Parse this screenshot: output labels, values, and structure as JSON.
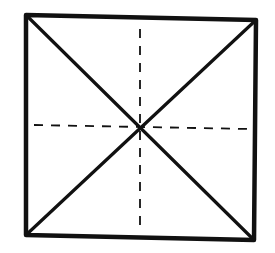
{
  "diagram": {
    "background": "#ffffff",
    "stroke_color": "#111111",
    "square": {
      "corners": {
        "top_left": [
          26,
          15
        ],
        "top_right": [
          256,
          20
        ],
        "bottom_right": [
          254,
          240
        ],
        "bottom_left": [
          26,
          235
        ]
      },
      "stroke_width": 4.5
    },
    "diagonals": [
      {
        "name": "diagonal-tl-br",
        "from": [
          26,
          15
        ],
        "to": [
          254,
          240
        ],
        "style": "solid",
        "stroke_width": 3.2
      },
      {
        "name": "diagonal-tr-bl",
        "from": [
          256,
          20
        ],
        "to": [
          26,
          235
        ],
        "style": "solid",
        "stroke_width": 3.2
      }
    ],
    "fold_lines": [
      {
        "name": "vertical-fold-line",
        "from": [
          140,
          29
        ],
        "to": [
          140,
          231
        ],
        "style": "dashed",
        "dash": "9 8",
        "stroke_width": 1.8
      },
      {
        "name": "horizontal-fold-line",
        "from": [
          34,
          125
        ],
        "to": [
          250,
          129
        ],
        "style": "dashed",
        "dash": "9 8",
        "stroke_width": 1.8
      }
    ],
    "center_point": [
      143,
      127
    ]
  }
}
